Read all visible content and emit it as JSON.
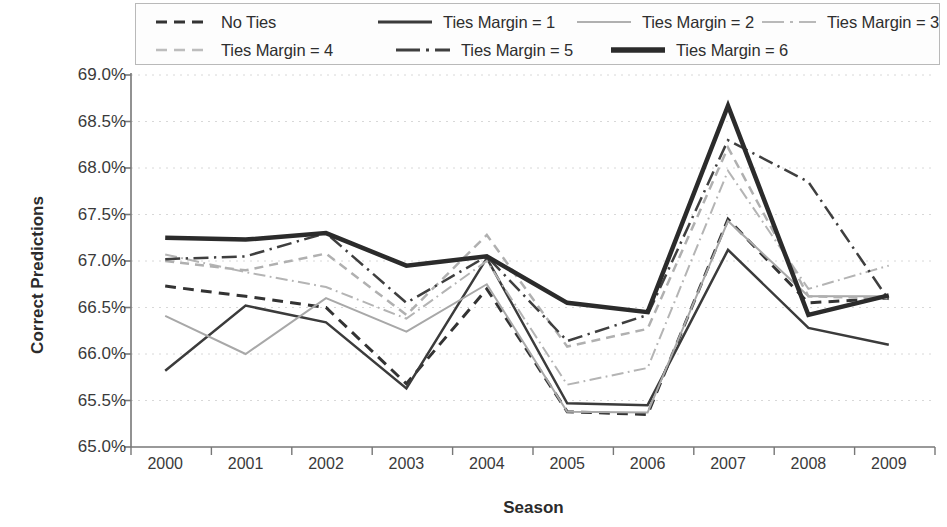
{
  "chart_data": {
    "type": "line",
    "title": "",
    "xlabel": "Season",
    "ylabel": "Correct Predictions",
    "categories": [
      "2000",
      "2001",
      "2002",
      "2003",
      "2004",
      "2005",
      "2006",
      "2007",
      "2008",
      "2009"
    ],
    "x_tick_labels": [
      "2000",
      "2001",
      "2002",
      "2003",
      "2004",
      "2005",
      "2006",
      "2007",
      "2008",
      "2009"
    ],
    "y_tick_labels": [
      "69.0%",
      "68.5%",
      "68.0%",
      "67.5%",
      "67.0%",
      "66.5%",
      "66.0%",
      "65.5%",
      "65.0%"
    ],
    "y_tick_values": [
      69.0,
      68.5,
      68.0,
      67.5,
      67.0,
      66.5,
      66.0,
      65.5,
      65.0
    ],
    "ylim": [
      65.0,
      69.0
    ],
    "y_unit": "%",
    "grid": "horizontal-dotted",
    "legend_position": "top",
    "series": [
      {
        "name": "No Ties",
        "style": "dashed",
        "color": "#333333",
        "width": 3,
        "values": [
          66.73,
          66.62,
          66.5,
          65.68,
          66.7,
          65.38,
          65.35,
          67.45,
          66.55,
          66.6
        ]
      },
      {
        "name": "Ties Margin = 1",
        "style": "solid",
        "color": "#3b3b3b",
        "width": 2.5,
        "values": [
          65.82,
          66.52,
          66.34,
          65.63,
          67.03,
          65.47,
          65.45,
          67.12,
          66.28,
          66.1
        ]
      },
      {
        "name": "Ties Margin = 2",
        "style": "solid",
        "color": "#a8a8a8",
        "width": 2,
        "values": [
          66.41,
          66.0,
          66.6,
          66.24,
          66.75,
          65.38,
          65.37,
          67.43,
          66.62,
          66.62
        ]
      },
      {
        "name": "Ties Margin = 3",
        "style": "dash-dot",
        "color": "#b4b4b4",
        "width": 2,
        "values": [
          67.07,
          66.88,
          66.72,
          66.38,
          67.0,
          65.67,
          65.85,
          67.97,
          66.7,
          66.95
        ]
      },
      {
        "name": "Ties Margin = 4",
        "style": "dashed",
        "color": "#b0b0b0",
        "width": 2.5,
        "values": [
          67.0,
          66.9,
          67.08,
          66.42,
          67.28,
          66.08,
          66.27,
          68.22,
          66.62,
          66.6
        ]
      },
      {
        "name": "Ties Margin = 5",
        "style": "dash-dot",
        "color": "#3f3f3f",
        "width": 2.5,
        "values": [
          67.02,
          67.05,
          67.3,
          66.55,
          67.05,
          66.14,
          66.42,
          68.3,
          67.85,
          66.58
        ]
      },
      {
        "name": "Ties Margin = 6",
        "style": "solid",
        "color": "#2b2b2b",
        "width": 4.5,
        "values": [
          67.25,
          67.23,
          67.3,
          66.95,
          67.05,
          66.55,
          66.45,
          68.67,
          66.42,
          66.63
        ]
      }
    ]
  },
  "legend": {
    "rows": [
      [
        {
          "label": "No Ties",
          "key": "dashed-dark"
        },
        {
          "label": "Ties Margin = 1",
          "key": "solid-dark"
        },
        {
          "label": "Ties Margin = 2",
          "key": "solid-light"
        },
        {
          "label": "Ties Margin = 3",
          "key": "dashdot-light"
        }
      ],
      [
        {
          "label": "Ties Margin = 4",
          "key": "dashed-light"
        },
        {
          "label": "Ties Margin = 5",
          "key": "dashdot-dark"
        },
        {
          "label": "Ties Margin = 6",
          "key": "thick-dark"
        }
      ]
    ]
  }
}
